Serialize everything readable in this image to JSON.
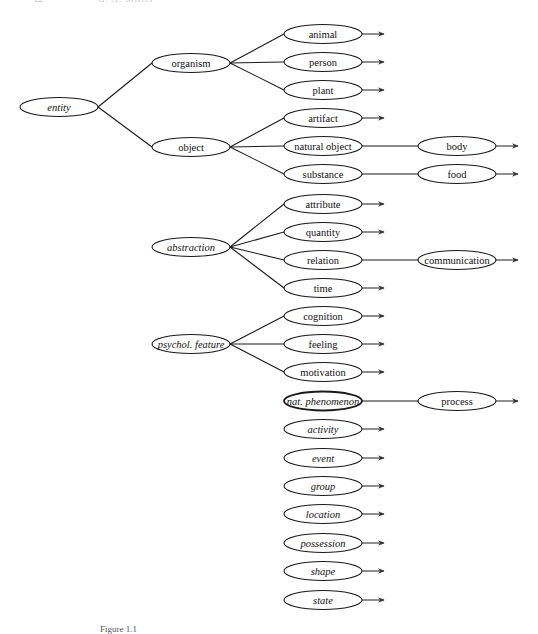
{
  "page": {
    "running_head_page": "22",
    "running_head_author": "G. A. Miller",
    "caption": "Figure 1.1"
  },
  "nodes": [
    {
      "id": "entity",
      "label": "entity",
      "italic": true,
      "cx": 59,
      "cy": 107
    },
    {
      "id": "organism",
      "label": "organism",
      "italic": false,
      "cx": 191,
      "cy": 63
    },
    {
      "id": "object",
      "label": "object",
      "italic": false,
      "cx": 191,
      "cy": 147
    },
    {
      "id": "animal",
      "label": "animal",
      "italic": false,
      "cx": 323,
      "cy": 34,
      "arrow": true
    },
    {
      "id": "person",
      "label": "person",
      "italic": false,
      "cx": 323,
      "cy": 62,
      "arrow": true
    },
    {
      "id": "plant",
      "label": "plant",
      "italic": false,
      "cx": 323,
      "cy": 90,
      "arrow": true
    },
    {
      "id": "artifact",
      "label": "artifact",
      "italic": false,
      "cx": 323,
      "cy": 118,
      "arrow": true
    },
    {
      "id": "natural-object",
      "label": "natural object",
      "italic": false,
      "cx": 323,
      "cy": 146
    },
    {
      "id": "substance",
      "label": "substance",
      "italic": false,
      "cx": 323,
      "cy": 174
    },
    {
      "id": "body",
      "label": "body",
      "italic": false,
      "cx": 457,
      "cy": 146,
      "arrow": true
    },
    {
      "id": "food",
      "label": "food",
      "italic": false,
      "cx": 457,
      "cy": 174,
      "arrow": true
    },
    {
      "id": "abstraction",
      "label": "abstraction",
      "italic": true,
      "cx": 191,
      "cy": 247
    },
    {
      "id": "attribute",
      "label": "attribute",
      "italic": false,
      "cx": 323,
      "cy": 204,
      "arrow": true
    },
    {
      "id": "quantity",
      "label": "quantity",
      "italic": false,
      "cx": 323,
      "cy": 232,
      "arrow": true
    },
    {
      "id": "relation",
      "label": "relation",
      "italic": false,
      "cx": 323,
      "cy": 260
    },
    {
      "id": "time",
      "label": "time",
      "italic": false,
      "cx": 323,
      "cy": 288,
      "arrow": true
    },
    {
      "id": "communication",
      "label": "communication",
      "italic": false,
      "cx": 457,
      "cy": 260,
      "arrow": true
    },
    {
      "id": "psychol-feature",
      "label": "psychol. feature",
      "italic": true,
      "cx": 191,
      "cy": 344
    },
    {
      "id": "cognition",
      "label": "cognition",
      "italic": false,
      "cx": 323,
      "cy": 316,
      "arrow": true
    },
    {
      "id": "feeling",
      "label": "feeling",
      "italic": false,
      "cx": 323,
      "cy": 344,
      "arrow": true
    },
    {
      "id": "motivation",
      "label": "motivation",
      "italic": false,
      "cx": 323,
      "cy": 372,
      "arrow": true
    },
    {
      "id": "nat-phenomenon",
      "label": "nat. phenomenon",
      "italic": true,
      "bold": true,
      "cx": 323,
      "cy": 401
    },
    {
      "id": "process",
      "label": "process",
      "italic": false,
      "cx": 457,
      "cy": 401,
      "arrow": true
    },
    {
      "id": "activity",
      "label": "activity",
      "italic": true,
      "cx": 323,
      "cy": 429,
      "arrow": true
    },
    {
      "id": "event",
      "label": "event",
      "italic": true,
      "cx": 323,
      "cy": 458,
      "arrow": true
    },
    {
      "id": "group",
      "label": "group",
      "italic": true,
      "cx": 323,
      "cy": 486,
      "arrow": true
    },
    {
      "id": "location",
      "label": "location",
      "italic": true,
      "cx": 323,
      "cy": 514,
      "arrow": true
    },
    {
      "id": "possession",
      "label": "possession",
      "italic": true,
      "cx": 323,
      "cy": 543,
      "arrow": true
    },
    {
      "id": "shape",
      "label": "shape",
      "italic": true,
      "cx": 323,
      "cy": 571,
      "arrow": true
    },
    {
      "id": "state",
      "label": "state",
      "italic": true,
      "cx": 323,
      "cy": 600,
      "arrow": true
    }
  ],
  "edges": [
    [
      "entity",
      "organism"
    ],
    [
      "entity",
      "object"
    ],
    [
      "organism",
      "animal"
    ],
    [
      "organism",
      "person"
    ],
    [
      "organism",
      "plant"
    ],
    [
      "object",
      "artifact"
    ],
    [
      "object",
      "natural-object"
    ],
    [
      "object",
      "substance"
    ],
    [
      "natural-object",
      "body"
    ],
    [
      "substance",
      "food"
    ],
    [
      "abstraction",
      "attribute"
    ],
    [
      "abstraction",
      "quantity"
    ],
    [
      "abstraction",
      "relation"
    ],
    [
      "abstraction",
      "time"
    ],
    [
      "relation",
      "communication"
    ],
    [
      "psychol-feature",
      "cognition"
    ],
    [
      "psychol-feature",
      "feeling"
    ],
    [
      "psychol-feature",
      "motivation"
    ],
    [
      "nat-phenomenon",
      "process"
    ]
  ],
  "style": {
    "node_rx": 39,
    "node_ry": 9.5,
    "stroke_color": "#1a1a1a",
    "background": "#ffffff"
  }
}
